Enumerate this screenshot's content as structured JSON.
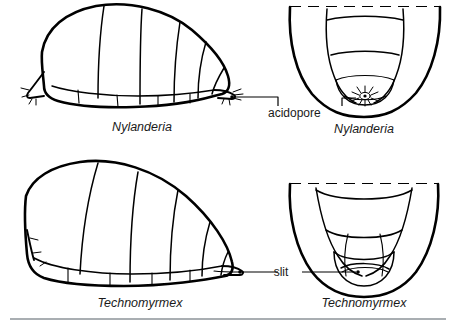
{
  "figure": {
    "background_color": "#ffffff",
    "ink_color": "#000000",
    "rule_color": "#a9aeb2"
  },
  "panels": [
    {
      "id": "nylanderia-lateral",
      "view": "lateral",
      "caption": "Nylanderia",
      "genus": "Nylanderia",
      "apex_structure": "acidopore",
      "position": "top-left"
    },
    {
      "id": "nylanderia-posterior",
      "view": "posterior",
      "caption": "Nylanderia",
      "genus": "Nylanderia",
      "apex_structure": "acidopore",
      "position": "top-right"
    },
    {
      "id": "technomyrmex-lateral",
      "view": "lateral",
      "caption": "Technomyrmex",
      "genus": "Technomyrmex",
      "apex_structure": "slit",
      "position": "bottom-left"
    },
    {
      "id": "technomyrmex-posterior",
      "view": "posterior",
      "caption": "Technomyrmex",
      "genus": "Technomyrmex",
      "apex_structure": "slit",
      "position": "bottom-right"
    }
  ],
  "annotations": [
    {
      "id": "acidopore",
      "label": "acidopore",
      "style": "bracket-leaders",
      "points_to": [
        "nylanderia-lateral",
        "nylanderia-posterior"
      ]
    },
    {
      "id": "slit",
      "label": "slit",
      "style": "straight-leaders",
      "points_to": [
        "technomyrmex-lateral",
        "technomyrmex-posterior"
      ]
    }
  ],
  "captions": {
    "top_left": "Nylanderia",
    "top_right": "Nylanderia",
    "bottom_left": "Technomyrmex",
    "bottom_right": "Technomyrmex"
  },
  "labels": {
    "acidopore": "acidopore",
    "slit": "slit"
  }
}
